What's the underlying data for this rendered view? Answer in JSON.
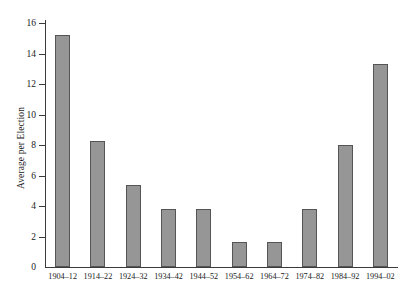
{
  "chart_data": {
    "type": "bar",
    "title": "",
    "xlabel": "",
    "ylabel": "Average per Election",
    "categories": [
      "1904–12",
      "1914–22",
      "1924–32",
      "1934–42",
      "1944–52",
      "1954–62",
      "1964–72",
      "1974–82",
      "1984–92",
      "1994–02"
    ],
    "values": [
      15.2,
      8.25,
      5.4,
      3.8,
      3.8,
      1.65,
      1.65,
      3.8,
      8.0,
      13.3
    ],
    "ylim": [
      0,
      16
    ],
    "ytick_labels": [
      "0",
      "2",
      "4",
      "6",
      "8",
      "10",
      "12",
      "14",
      "16"
    ],
    "ytick_values": [
      0,
      2,
      4,
      6,
      8,
      10,
      12,
      14,
      16
    ],
    "grid": false,
    "legend": false,
    "bar_color": "#969696",
    "bar_border_color": "#555555",
    "axis_color": "#3b3b3b"
  }
}
